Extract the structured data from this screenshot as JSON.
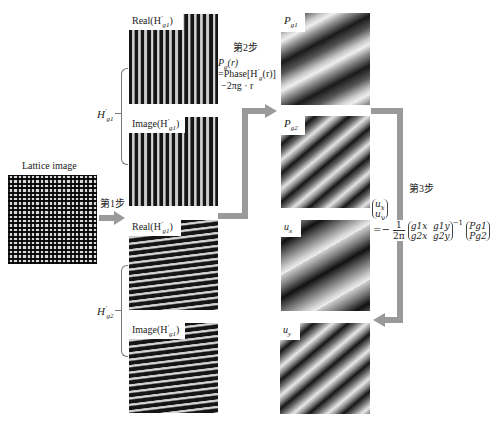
{
  "figure": {
    "lattice": {
      "label": "Lattice image"
    },
    "step1": {
      "label": "第1步"
    },
    "step2": {
      "label": "第2步",
      "formula_line1": "P",
      "formula_line1_sub": "g",
      "formula_line1_tail": "(r)",
      "formula_line2": "=Phase[H",
      "formula_line2_sup": "′",
      "formula_line2_sub": "g",
      "formula_line2_tail": "(r)]",
      "formula_line3": "−2πg · r"
    },
    "step3": {
      "label": "第3步",
      "vector_top": "u",
      "vector_top_sub": "x",
      "vector_bottom": "u",
      "vector_bottom_sub": "y",
      "equals": "=−",
      "frac_num": "1",
      "frac_den": "2π",
      "matrix": [
        [
          "g1x",
          "g1y"
        ],
        [
          "g2x",
          "g2y"
        ]
      ],
      "inverse": "−1",
      "rhs": [
        "Pg1",
        "Pg2"
      ]
    },
    "group_g1": {
      "label": "H",
      "sup": "′",
      "sub": "g1"
    },
    "group_g2": {
      "label": "H",
      "sup": "′",
      "sub": "g2"
    },
    "panels": {
      "real_g1": {
        "label": "Real(H",
        "sup": "′",
        "sub": "g1",
        "tail": ")"
      },
      "image_g1": {
        "label": "Image(H",
        "sup": "′",
        "sub": "g1",
        "tail": ")"
      },
      "real_g2": {
        "label": "Real(H",
        "sup": "′",
        "sub": "g1",
        "tail": ")"
      },
      "image_g2": {
        "label": "Image(H",
        "sup": "′",
        "sub": "g1",
        "tail": ")"
      },
      "pg1": {
        "label": "P",
        "sub": "g1"
      },
      "pg2": {
        "label": "P",
        "sub": "g2"
      },
      "ux": {
        "label": "u",
        "sub": "x"
      },
      "uy": {
        "label": "u",
        "sub": "y"
      }
    },
    "colors": {
      "arrow": "#9a9a9a",
      "background": "#ffffff"
    }
  }
}
